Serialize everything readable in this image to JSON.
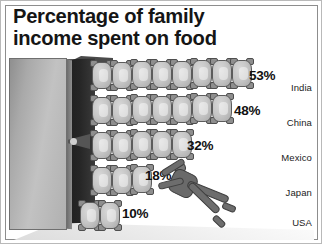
{
  "chart_data": {
    "type": "bar",
    "title": "Percentage of family\nincome spent on food",
    "categories": [
      "India",
      "China",
      "Mexico",
      "Japan",
      "USA"
    ],
    "values": [
      53,
      48,
      32,
      18,
      10
    ],
    "value_labels": [
      "53%",
      "48%",
      "32%",
      "18%",
      "10%"
    ],
    "unit": "%",
    "xlabel": "",
    "ylabel": "",
    "xlim": [
      0,
      60
    ],
    "grid": false,
    "legend": "none",
    "style": "pictogram",
    "pictogram_symbol": "sack-of-food",
    "symbol_counts": [
      8,
      7,
      5,
      3,
      2
    ],
    "annotations": [
      "worker-figure-pushing-sacks"
    ]
  },
  "colors": {
    "background": "#ffffff",
    "frame_border": "#8d8d8d",
    "title_text": "#151515",
    "panel_face": "#c2c2c2",
    "panel_shadow": "#1d1d1d",
    "sack_fill": "#c6c6c6",
    "sack_outline": "#5c5c5c",
    "figure": "#6d6d6d"
  },
  "rows": [
    {
      "label": "India",
      "value_label": "53%",
      "count": 8,
      "top": 4,
      "left": 84,
      "pct_left": 243,
      "pct_top": 12
    },
    {
      "label": "China",
      "value_label": "48%",
      "count": 7,
      "top": 39,
      "left": 84,
      "pct_left": 228,
      "pct_top": 47
    },
    {
      "label": "Mexico",
      "value_label": "32%",
      "count": 5,
      "top": 74,
      "left": 84,
      "pct_left": 181,
      "pct_top": 82
    },
    {
      "label": "Japan",
      "value_label": "18%",
      "count": 3,
      "top": 109,
      "left": 84,
      "pct_left": 139,
      "pct_top": 112
    },
    {
      "label": "USA",
      "value_label": "10%",
      "count": 2,
      "top": 144,
      "left": 72,
      "pct_left": 116,
      "pct_top": 150
    }
  ],
  "country_label_tops": [
    26,
    61,
    96,
    131,
    161
  ]
}
